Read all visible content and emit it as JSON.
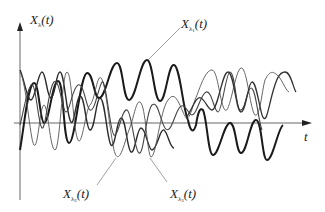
{
  "figure": {
    "type": "random-process-sample-functions",
    "y_axis_label": {
      "main": "X",
      "sub": "λ",
      "arg": "(t)"
    },
    "x_axis_label": "t",
    "curve_labels": [
      {
        "id": "x1",
        "main": "X",
        "sub": "λ",
        "subsub": "1",
        "arg": "(t)"
      },
      {
        "id": "x2",
        "main": "X",
        "sub": "λ",
        "subsub": "2",
        "arg": "(t)"
      },
      {
        "id": "x3",
        "main": "X",
        "sub": "λ",
        "subsub": "3",
        "arg": "(t)"
      }
    ],
    "colors": {
      "axis": "#555555",
      "curve_thick": "#1a1a1a",
      "curve_medium": "#333333",
      "curve_thin": "#555555",
      "leader": "#777777",
      "background": "#ffffff"
    }
  }
}
